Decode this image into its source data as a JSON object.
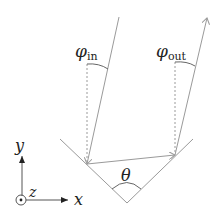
{
  "diagram": {
    "labels": {
      "phi_in": "φ",
      "phi_in_sub": "in",
      "phi_out": "φ",
      "phi_out_sub": "out",
      "theta": "θ",
      "axis_x": "x",
      "axis_y": "y",
      "axis_z": "z"
    },
    "colors": {
      "line": "#9a9a9a",
      "axis": "#555555",
      "text": "#222222",
      "background": "#ffffff"
    }
  }
}
